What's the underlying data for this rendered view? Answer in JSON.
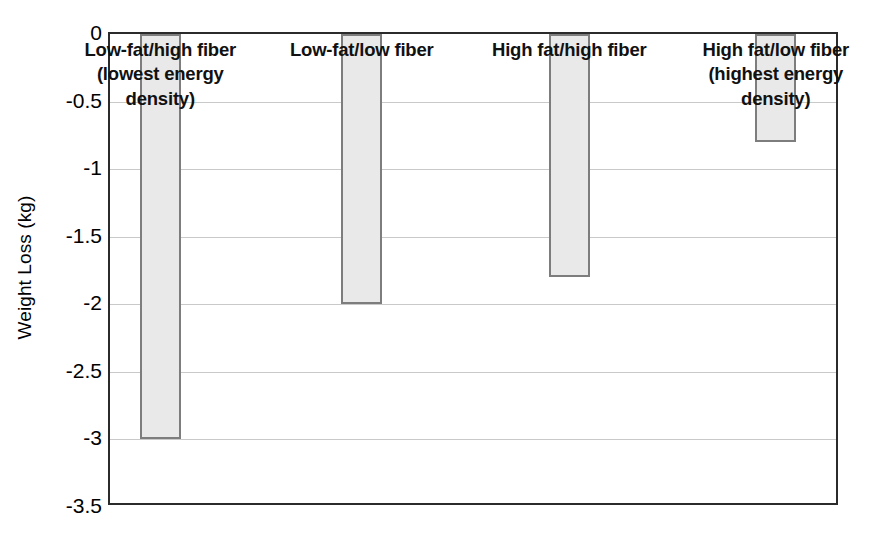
{
  "chart_data": {
    "type": "bar",
    "title": "",
    "subtitle": "",
    "xlabel": "",
    "ylabel": "Weight Loss (kg)",
    "ylim": [
      -3.5,
      0
    ],
    "yticks": [
      0,
      -0.5,
      -1,
      -1.5,
      -2,
      -2.5,
      -3,
      -3.5
    ],
    "ytick_labels": [
      "0",
      "-0.5",
      "-1",
      "-1.5",
      "-2",
      "-2.5",
      "-3",
      "-3.5"
    ],
    "grid": true,
    "legend": "none",
    "orientation": "vertical-downward",
    "categories": [
      "Low-fat/high fiber (lowest energy density)",
      "Low-fat/low fiber",
      "High fat/high fiber",
      "High fat/low fiber (highest energy density)"
    ],
    "values": [
      -3.0,
      -2.0,
      -1.8,
      -0.8
    ],
    "bar_labels": [
      "Low-fat/high fiber\n(lowest energy\ndensity)",
      "Low-fat/low fiber",
      "High fat/high fiber",
      "High fat/low fiber\n(highest energy\ndensity)"
    ],
    "colors": {
      "bar_fill": "#e9e9e9",
      "bar_border": "#7d7d7d",
      "axis": "#2b2b2b",
      "gridline": "#c9c9c9",
      "text": "#111111"
    }
  },
  "axis": {
    "y_title": "Weight Loss (kg)"
  }
}
